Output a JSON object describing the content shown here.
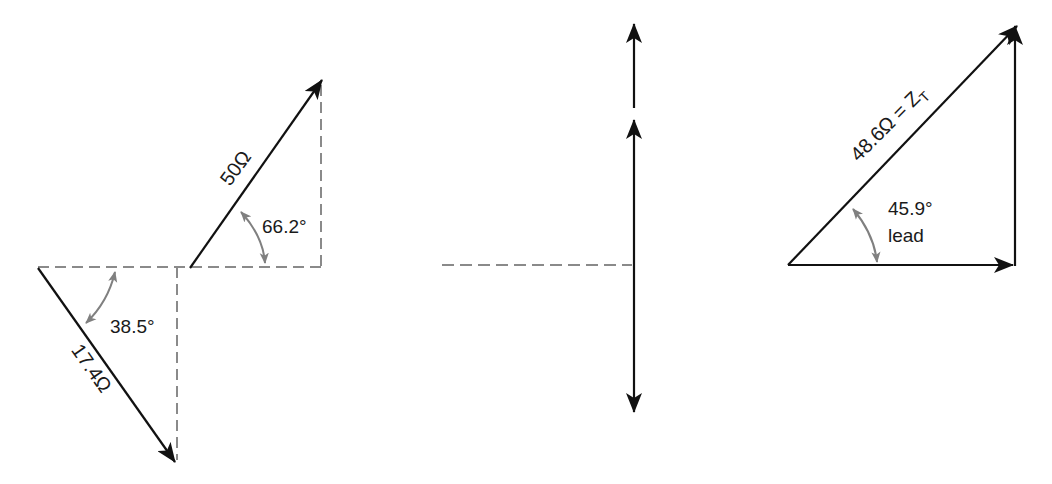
{
  "colors": {
    "vector": "#111111",
    "dashed": "#8a8a8a",
    "arc": "#808080",
    "background": "#ffffff"
  },
  "figures": [
    {
      "id": "left",
      "description": "Two impedance vectors with horizontal/vertical dashed reference lines",
      "vectors": [
        {
          "label": "50Ω",
          "magnitude": "50",
          "unit": "Ω",
          "angle": "66.2°"
        },
        {
          "label": "17.4Ω",
          "magnitude": "17.4",
          "unit": "Ω",
          "angle": "38.5°"
        }
      ],
      "angle_labels": [
        "66.2°",
        "38.5°"
      ]
    },
    {
      "id": "middle",
      "description": "Vertical components drawn with arrows and a dashed horizontal reference line",
      "vectors": []
    },
    {
      "id": "right",
      "description": "Resultant impedance triangle",
      "vectors": [
        {
          "label": "48.6Ω = Z",
          "subscript": "T",
          "magnitude": "48.6",
          "unit": "Ω"
        }
      ],
      "angle_label": "45.9°",
      "angle_note": "lead"
    }
  ]
}
